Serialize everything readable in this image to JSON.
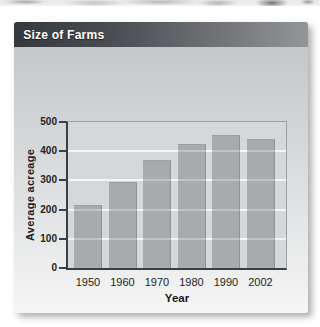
{
  "panel": {
    "title": "Size of Farms",
    "source": "Source: U.S. Department of Agriculture"
  },
  "chart_data": {
    "type": "bar",
    "title": "Size of Farms",
    "categories": [
      "1950",
      "1960",
      "1970",
      "1980",
      "1990",
      "2002"
    ],
    "values": [
      215,
      295,
      370,
      425,
      455,
      443
    ],
    "xlabel": "Year",
    "ylabel": "Average acreage",
    "ylim": [
      0,
      500
    ],
    "yticks": [
      0,
      100,
      200,
      300,
      400,
      500
    ],
    "grid": "horizontal",
    "legend": "none",
    "source": "Source: U.S. Department of Agriculture",
    "bar_color": "#a8aaad",
    "plot_bg": "#d6d7d9"
  },
  "colors": {
    "header_gradient_left": "#35383c",
    "header_gradient_right": "#939699",
    "axis": "#3c3e41",
    "gridline": "#f0f1f1",
    "gridline_overlay": "rgba(255,255,255,0.30)",
    "title_text": "#ffffff",
    "source_text": "#3f3f3f"
  }
}
